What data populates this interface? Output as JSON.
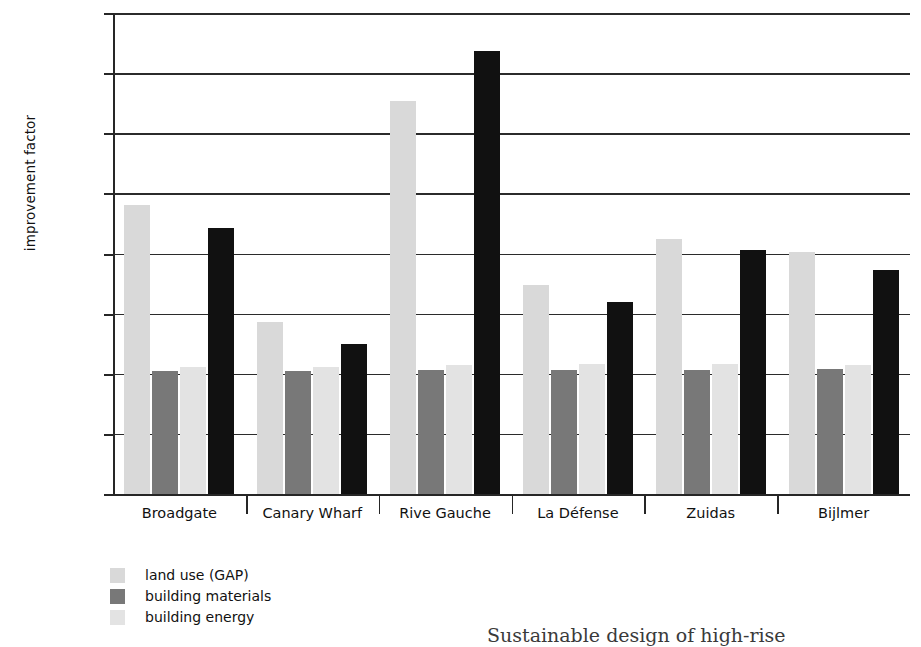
{
  "chart_data": {
    "type": "bar",
    "title": "",
    "xlabel": "",
    "ylabel": "improvement factor",
    "ylim": [
      0,
      4
    ],
    "ytick_labels": [
      "0,00",
      "0,50",
      "1,00",
      "1,50",
      "2,00",
      "2,50",
      "3,00",
      "3,50",
      "4,00"
    ],
    "ytick_values": [
      0,
      0.5,
      1.0,
      1.5,
      2.0,
      2.5,
      3.0,
      3.5,
      4.0
    ],
    "grid": true,
    "legend_position": "below-left",
    "categories": [
      "Broadgate",
      "Canary Wharf",
      "Rive Gauche",
      "La Défense",
      "Zuidas",
      "Bijlmer"
    ],
    "series": [
      {
        "name": "land use (GAP)",
        "color": "#d9d9d9",
        "values": [
          2.4,
          1.43,
          3.27,
          1.74,
          2.12,
          2.01
        ]
      },
      {
        "name": "building materials",
        "color": "#787878",
        "values": [
          1.02,
          1.02,
          1.03,
          1.03,
          1.03,
          1.04
        ]
      },
      {
        "name": "building energy",
        "color": "#e3e3e3",
        "values": [
          1.06,
          1.06,
          1.07,
          1.08,
          1.08,
          1.07
        ]
      },
      {
        "name": "",
        "color": "#111111",
        "values": [
          2.21,
          1.25,
          3.68,
          1.6,
          2.03,
          1.86
        ]
      }
    ]
  },
  "legend": {
    "items": [
      {
        "label": "land use (GAP)",
        "color": "#d9d9d9"
      },
      {
        "label": "building materials",
        "color": "#787878"
      },
      {
        "label": "building energy",
        "color": "#e3e3e3"
      }
    ]
  },
  "caption": {
    "text": "Sustainable design of high-rise"
  }
}
